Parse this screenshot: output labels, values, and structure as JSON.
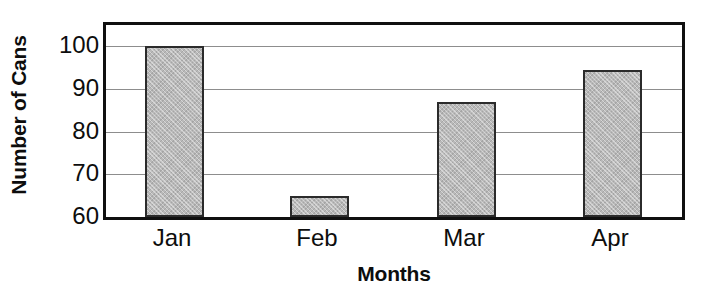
{
  "chart_data": {
    "type": "bar",
    "title": "",
    "xlabel": "Months",
    "ylabel": "Number of Cans",
    "categories": [
      "Jan",
      "Feb",
      "Mar",
      "Apr"
    ],
    "values": [
      100,
      65,
      87,
      94.5
    ],
    "ylim": [
      60,
      105
    ],
    "yticks": [
      60,
      70,
      80,
      90,
      100
    ],
    "ytick_labels": [
      "60",
      "70",
      "80",
      "90",
      "100"
    ],
    "grid": true,
    "legend": null,
    "orientation": "vertical",
    "bar_fill_color": "#b9b9b9",
    "bar_edge_color": "#2b2b2b",
    "gridline_color": "#8d8d8d",
    "frame_color": "#101010",
    "background_color": "#ffffff"
  }
}
